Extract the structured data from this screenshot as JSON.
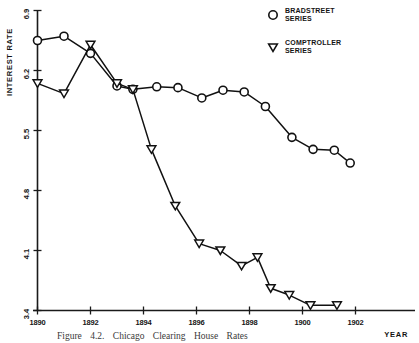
{
  "figure": {
    "caption": "Figure 4.2.  Chicago Clearing House Rates"
  },
  "legend": {
    "position": "top-right",
    "entries": [
      {
        "marker": "circle-marker-icon",
        "line1": "BRADSTREET",
        "line2": "SERIES"
      },
      {
        "marker": "triangle-down-marker-icon",
        "line1": "COMPTROLLER",
        "line2": "SERIES"
      }
    ]
  },
  "axes": {
    "ylabel": "INTEREST  RATE",
    "xlabel": "YEAR",
    "yticks": [
      "6.9",
      "6.2",
      "5.5",
      "4.8",
      "4.1",
      "3.4"
    ],
    "xticks": [
      "1890",
      "1892",
      "1894",
      "1896",
      "1898",
      "1900",
      "1902"
    ]
  },
  "chart_data": {
    "type": "line",
    "title": "",
    "xlabel": "YEAR",
    "ylabel": "INTEREST RATE",
    "xlim": [
      1890,
      1902
    ],
    "ylim": [
      3.4,
      6.9
    ],
    "ytick_values": [
      6.9,
      6.2,
      5.5,
      4.8,
      4.1,
      3.4
    ],
    "xtick_values": [
      1890,
      1892,
      1894,
      1896,
      1898,
      1900,
      1902
    ],
    "grid": false,
    "legend_position": "top-right",
    "series": [
      {
        "name": "BRADSTREET SERIES",
        "marker": "circle",
        "x": [
          1890.0,
          1891.0,
          1892.0,
          1893.0,
          1893.6,
          1894.5,
          1895.3,
          1896.2,
          1897.0,
          1897.8,
          1898.6,
          1899.6,
          1900.4,
          1901.2,
          1901.8
        ],
        "values": [
          6.55,
          6.6,
          6.4,
          6.02,
          5.98,
          6.01,
          6.0,
          5.88,
          5.97,
          5.95,
          5.78,
          5.42,
          5.28,
          5.27,
          5.12
        ]
      },
      {
        "name": "COMPTROLLER SERIES",
        "marker": "triangle-down",
        "x": [
          1890.0,
          1891.0,
          1892.0,
          1893.0,
          1893.6,
          1894.3,
          1895.2,
          1896.1,
          1896.9,
          1897.7,
          1898.3,
          1898.8,
          1899.5,
          1900.3,
          1901.3
        ],
        "values": [
          6.05,
          5.93,
          6.5,
          6.05,
          5.98,
          5.28,
          4.62,
          4.18,
          4.1,
          3.92,
          4.02,
          3.66,
          3.58,
          3.46,
          3.46
        ]
      }
    ]
  }
}
